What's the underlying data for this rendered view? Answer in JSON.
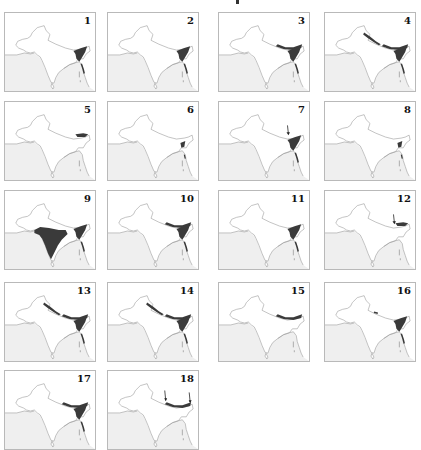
{
  "figure": {
    "type": "small-multiples distribution maps",
    "region": "Indian subcontinent",
    "colors": {
      "land": "#ffffff",
      "sea": "#efefef",
      "outline": "#9a9a9a",
      "range": "#3a3a3a",
      "border": "#b9b9b9"
    },
    "panels": [
      {
        "label": "1",
        "range": [
          "ne-india"
        ],
        "arrows": []
      },
      {
        "label": "2",
        "range": [
          "ne-india"
        ],
        "arrows": []
      },
      {
        "label": "3",
        "range": [
          "e-himalaya",
          "ne-india"
        ],
        "arrows": []
      },
      {
        "label": "4",
        "range": [
          "w-himalaya",
          "e-himalaya",
          "ne-india"
        ],
        "arrows": []
      },
      {
        "label": "5",
        "range": [
          "e-himalaya-patch"
        ],
        "arrows": []
      },
      {
        "label": "6",
        "range": [
          "ne-small"
        ],
        "arrows": []
      },
      {
        "label": "7",
        "range": [
          "ne-india"
        ],
        "arrows": [
          1
        ]
      },
      {
        "label": "8",
        "range": [
          "ne-small"
        ],
        "arrows": []
      },
      {
        "label": "9",
        "range": [
          "peninsular-india",
          "ne-india"
        ],
        "arrows": []
      },
      {
        "label": "10",
        "range": [
          "e-himalaya",
          "ne-india"
        ],
        "arrows": []
      },
      {
        "label": "11",
        "range": [
          "ne-india"
        ],
        "arrows": []
      },
      {
        "label": "12",
        "range": [
          "e-himalaya-patch"
        ],
        "arrows": [
          2
        ]
      },
      {
        "label": "13",
        "range": [
          "w-himalaya",
          "e-himalaya",
          "ne-india"
        ],
        "arrows": []
      },
      {
        "label": "14",
        "range": [
          "w-himalaya",
          "e-himalaya",
          "ne-india"
        ],
        "arrows": []
      },
      {
        "label": "15",
        "range": [
          "e-himalaya"
        ],
        "arrows": []
      },
      {
        "label": "16",
        "range": [
          "ne-india",
          "w-himalaya-dot"
        ],
        "arrows": []
      },
      {
        "label": "17",
        "range": [
          "e-himalaya",
          "ne-india"
        ],
        "arrows": []
      },
      {
        "label": "18",
        "range": [
          "e-himalaya"
        ],
        "arrows": [
          1,
          1
        ]
      }
    ]
  }
}
